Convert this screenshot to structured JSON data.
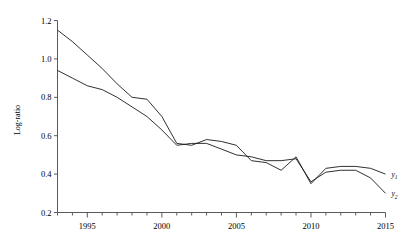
{
  "chart_data": {
    "type": "line",
    "title": "",
    "subtitle": "",
    "xlabel": "",
    "ylabel": "Log-ratio",
    "xlim": [
      1993,
      2015
    ],
    "ylim": [
      0.2,
      1.2
    ],
    "grid": false,
    "legend_position": "right-inline",
    "xticks": [
      1995,
      2000,
      2005,
      2010,
      2015
    ],
    "xtick_labels": [
      "1995",
      "2000",
      "2005",
      "2010",
      "2015"
    ],
    "yticks": [
      0.2,
      0.4,
      0.6,
      0.8,
      1.0,
      1.2
    ],
    "ytick_labels": [
      "0.2",
      "0.4",
      "0.6",
      "0.8",
      "1.0",
      "1.2"
    ],
    "minor_xticks_every": 1,
    "x": [
      1993,
      1994,
      1995,
      1996,
      1997,
      1998,
      1999,
      2000,
      2001,
      2002,
      2003,
      2004,
      2005,
      2006,
      2007,
      2008,
      2009,
      2010,
      2011,
      2012,
      2013,
      2014,
      2015
    ],
    "series": [
      {
        "name": "y1",
        "label": "y",
        "sublabel": "1",
        "color": "#1a1a1a",
        "values": [
          1.15,
          1.09,
          1.02,
          0.95,
          0.87,
          0.8,
          0.79,
          0.7,
          0.56,
          0.55,
          0.58,
          0.57,
          0.55,
          0.47,
          0.46,
          0.42,
          0.49,
          0.35,
          0.43,
          0.44,
          0.44,
          0.43,
          0.4
        ]
      },
      {
        "name": "y2",
        "label": "y",
        "sublabel": "2",
        "color": "#1a1a1a",
        "values": [
          0.94,
          0.9,
          0.86,
          0.84,
          0.8,
          0.75,
          0.7,
          0.63,
          0.55,
          0.56,
          0.56,
          0.53,
          0.5,
          0.49,
          0.47,
          0.47,
          0.48,
          0.36,
          0.41,
          0.42,
          0.42,
          0.38,
          0.3
        ]
      }
    ]
  }
}
